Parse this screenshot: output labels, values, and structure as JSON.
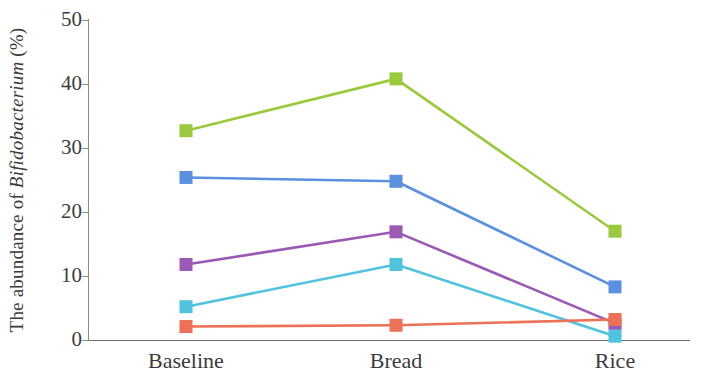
{
  "chart_data": {
    "type": "line",
    "title": "",
    "xlabel": "",
    "ylabel": "The abundance of Bifidobacterium (%)",
    "ylabel_plain": "The abundance of ",
    "ylabel_italic": "Bifidobacterium",
    "ylabel_suffix": " (%)",
    "categories": [
      "Baseline",
      "Bread",
      "Rice"
    ],
    "ylim": [
      0,
      50
    ],
    "yticks": [
      0,
      10,
      20,
      30,
      40,
      50
    ],
    "ytick_labels": [
      "0",
      "10",
      "20",
      "30",
      "40",
      "50"
    ],
    "grid": false,
    "legend": "none",
    "marker": "square",
    "series": [
      {
        "name": "series-green",
        "color": "#9ACA3C",
        "values": [
          32.7,
          40.8,
          17.0
        ]
      },
      {
        "name": "series-blue",
        "color": "#5B8FE0",
        "values": [
          25.4,
          24.8,
          8.3
        ]
      },
      {
        "name": "series-purple",
        "color": "#9B59B6",
        "values": [
          11.8,
          16.9,
          2.6
        ]
      },
      {
        "name": "series-cyan",
        "color": "#4FC3E0",
        "values": [
          5.2,
          11.8,
          0.6
        ]
      },
      {
        "name": "series-orange",
        "color": "#EC7157",
        "values": [
          2.1,
          2.3,
          3.2
        ]
      }
    ]
  },
  "axis": {
    "y_tick_labels": [
      "50",
      "40",
      "30",
      "20",
      "10",
      "0"
    ],
    "x_categories": [
      "Baseline",
      "Bread",
      "Rice"
    ]
  }
}
